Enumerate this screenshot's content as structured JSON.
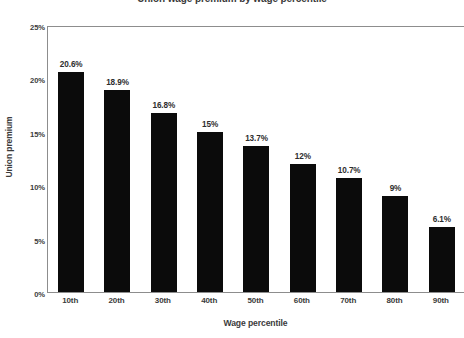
{
  "chart_data": {
    "type": "bar",
    "title": "Union wage premium by wage percentile",
    "xlabel": "Wage percentile",
    "ylabel": "Union premium",
    "categories": [
      "10th",
      "20th",
      "30th",
      "40th",
      "50th",
      "60th",
      "70th",
      "80th",
      "90th"
    ],
    "values": [
      20.6,
      18.9,
      16.8,
      15.0,
      13.7,
      12.0,
      10.7,
      9.0,
      6.1
    ],
    "data_labels": [
      "20.6%",
      "18.9%",
      "16.8%",
      "15%",
      "13.7%",
      "12%",
      "10.7%",
      "9%",
      "6.1%"
    ],
    "ylim": [
      0,
      25
    ],
    "yticks": [
      0,
      5,
      10,
      15,
      20,
      25
    ],
    "ytick_labels": [
      "0%",
      "5%",
      "10%",
      "15%",
      "20%",
      "25%"
    ],
    "grid": false,
    "legend": "none",
    "bar_color": "#0b0b0b",
    "axis_color": "#8d8d8d",
    "text_color": "#3b3b3b",
    "background": "#ffffff"
  }
}
